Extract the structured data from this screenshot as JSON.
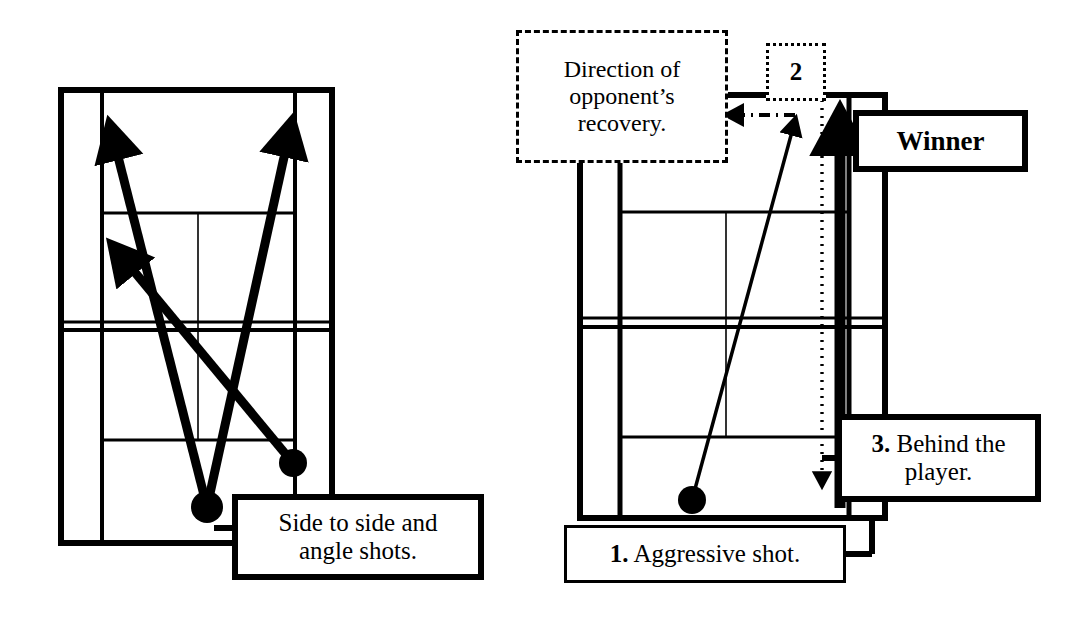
{
  "page": {
    "background": "#ffffff",
    "ink": "#000000",
    "width": 1084,
    "height": 626
  },
  "left_diagram": {
    "name": "Side to side and angle shots",
    "callout": {
      "line1": "Side to side and",
      "line2": "angle shots.",
      "border": "thick-solid"
    },
    "court": {
      "outer": {
        "x": 61,
        "y": 90,
        "w": 271,
        "h": 453
      },
      "line_color": "#000000"
    },
    "shots": [
      {
        "id": "shot-a",
        "label": "",
        "from": [
          207,
          507
        ],
        "to": [
          108,
          125
        ],
        "style": "thick-solid-arrow"
      },
      {
        "id": "shot-b",
        "label": "",
        "from": [
          207,
          507
        ],
        "to": [
          292,
          122
        ],
        "style": "thick-solid-arrow"
      },
      {
        "id": "shot-c",
        "label": "",
        "from": [
          293,
          463
        ],
        "to": [
          113,
          246
        ],
        "style": "thick-solid-arrow"
      }
    ],
    "ball_positions": [
      {
        "id": "ball-center",
        "x": 207,
        "y": 507
      },
      {
        "id": "ball-right",
        "x": 293,
        "y": 463
      }
    ]
  },
  "right_diagram": {
    "name": "Aggressive shot sequence ending in a winner",
    "callouts": {
      "direction": {
        "line1": "Direction of",
        "line2": "opponent’s",
        "line3": "recovery.",
        "border": "dash-dot"
      },
      "step_two": {
        "text": "2",
        "border": "dotted"
      },
      "winner": {
        "text": "Winner",
        "border": "thick-solid"
      },
      "step_three": {
        "number": "3.",
        "line1": "Behind the",
        "line2": "player.",
        "border": "thick-solid"
      },
      "step_one": {
        "number": "1.",
        "text": "Aggressive shot.",
        "border": "thin-solid"
      }
    },
    "court": {
      "outer": {
        "x": 580,
        "y": 95,
        "w": 305,
        "h": 423
      },
      "line_color": "#000000"
    },
    "shots": [
      {
        "id": "shot-1-aggressive",
        "step": "1",
        "from": [
          692,
          500
        ],
        "to": [
          791,
          118
        ],
        "style": "thin-solid-arrow"
      },
      {
        "id": "shot-2-recovery",
        "step": "2",
        "from": [
          822,
          110
        ],
        "to": [
          822,
          490
        ],
        "style": "dotted-arrow-down"
      },
      {
        "id": "shot-3-behind-player",
        "step": "3",
        "from": [
          840,
          508
        ],
        "to": [
          840,
          112
        ],
        "style": "very-thick-solid-arrow"
      },
      {
        "id": "opponent-recovery-direction",
        "step": "",
        "from": [
          790,
          115
        ],
        "to": [
          722,
          115
        ],
        "style": "dash-dot-arrow-left"
      }
    ],
    "ball_positions": [
      {
        "id": "ball-baseline",
        "x": 692,
        "y": 500
      }
    ]
  }
}
